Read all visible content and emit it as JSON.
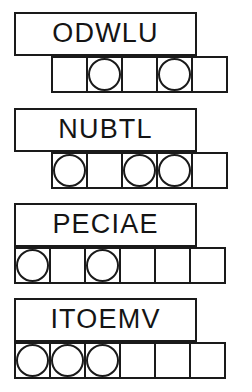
{
  "sheet": {
    "title": "Scrambled Word Puzzle Worksheet",
    "background_color": "#ffffff",
    "ink_color": "#1a1a1a"
  },
  "rows": [
    {
      "id": "row-1",
      "word": "ODWLU",
      "letter_count": 5,
      "word_box": {
        "x": 14,
        "y": 12,
        "width": 183,
        "height": 44
      },
      "cell_row": {
        "x": 51,
        "y": 56,
        "cell_size": 37,
        "cell_count": 5
      },
      "cells": [
        {
          "index": 1,
          "circled": false
        },
        {
          "index": 2,
          "circled": true
        },
        {
          "index": 3,
          "circled": false
        },
        {
          "index": 4,
          "circled": true
        },
        {
          "index": 5,
          "circled": false
        }
      ]
    },
    {
      "id": "row-2",
      "word": "NUBTL",
      "letter_count": 5,
      "word_box": {
        "x": 14,
        "y": 108,
        "width": 183,
        "height": 44
      },
      "cell_row": {
        "x": 51,
        "y": 152,
        "cell_size": 37,
        "cell_count": 5
      },
      "cells": [
        {
          "index": 1,
          "circled": true
        },
        {
          "index": 2,
          "circled": false
        },
        {
          "index": 3,
          "circled": true
        },
        {
          "index": 4,
          "circled": true
        },
        {
          "index": 5,
          "circled": false
        }
      ]
    },
    {
      "id": "row-3",
      "word": "PECIAE",
      "letter_count": 6,
      "word_box": {
        "x": 14,
        "y": 203,
        "width": 183,
        "height": 44
      },
      "cell_row": {
        "x": 14,
        "y": 247,
        "cell_size": 37,
        "cell_count": 6
      },
      "cells": [
        {
          "index": 1,
          "circled": true
        },
        {
          "index": 2,
          "circled": false
        },
        {
          "index": 3,
          "circled": true
        },
        {
          "index": 4,
          "circled": false
        },
        {
          "index": 5,
          "circled": false
        },
        {
          "index": 6,
          "circled": false
        }
      ]
    },
    {
      "id": "row-4",
      "word": "ITOEMV",
      "letter_count": 6,
      "word_box": {
        "x": 14,
        "y": 298,
        "width": 183,
        "height": 44
      },
      "cell_row": {
        "x": 14,
        "y": 342,
        "cell_size": 37,
        "cell_count": 6
      },
      "cells": [
        {
          "index": 1,
          "circled": true
        },
        {
          "index": 2,
          "circled": true
        },
        {
          "index": 3,
          "circled": true
        },
        {
          "index": 4,
          "circled": false
        },
        {
          "index": 5,
          "circled": false
        },
        {
          "index": 6,
          "circled": false
        }
      ]
    }
  ]
}
